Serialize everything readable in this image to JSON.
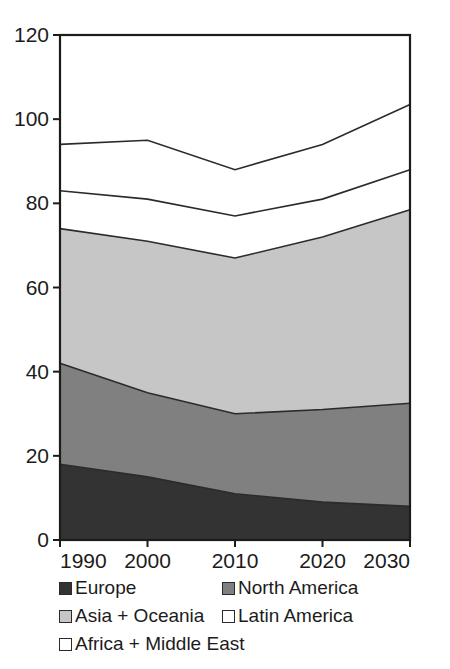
{
  "chart_data": {
    "type": "area",
    "stacked": true,
    "title": "",
    "subtitle": "",
    "xlabel": "",
    "ylabel": "",
    "categories": [
      "1990",
      "2000",
      "2010",
      "2020",
      "2030"
    ],
    "x": [
      1990,
      2000,
      2010,
      2020,
      2030
    ],
    "xlim": [
      1990,
      2030
    ],
    "ylim": [
      0,
      120
    ],
    "yticks": [
      0,
      20,
      40,
      60,
      80,
      100,
      120
    ],
    "ytick_labels": [
      "0",
      "20",
      "40",
      "60",
      "80",
      "100",
      "120"
    ],
    "xtick_labels": [
      "1990",
      "2000",
      "2010",
      "2020",
      "2030"
    ],
    "grid": "horizontal-at-100-only",
    "legend_position": "bottom",
    "series": [
      {
        "name": "Europe",
        "color": "#333333",
        "values": [
          18,
          15,
          11,
          9,
          8
        ],
        "cumulative": [
          18,
          15,
          11,
          9,
          8
        ]
      },
      {
        "name": "North America",
        "color": "#808080",
        "values": [
          24,
          20,
          19,
          22,
          24.5
        ],
        "cumulative": [
          42,
          35,
          30,
          31,
          32.5
        ]
      },
      {
        "name": "Asia + Oceania",
        "color": "#c6c6c6",
        "values": [
          32,
          36,
          37,
          41,
          46
        ],
        "cumulative": [
          74,
          71,
          67,
          72,
          78.5
        ]
      },
      {
        "name": "Latin America",
        "color": "#ffffff",
        "values": [
          9,
          10,
          10,
          9,
          9.5
        ],
        "cumulative": [
          83,
          81,
          77,
          81,
          88
        ]
      },
      {
        "name": "Africa + Middle East",
        "color": "#ffffff",
        "values": [
          11,
          14,
          11,
          13,
          15.5
        ],
        "cumulative": [
          94,
          95,
          88,
          94,
          103.5
        ]
      }
    ]
  },
  "axes": {
    "y_ticks": [
      {
        "label": "120",
        "value": 120
      },
      {
        "label": "100",
        "value": 100
      },
      {
        "label": "80",
        "value": 80
      },
      {
        "label": "60",
        "value": 60
      },
      {
        "label": "40",
        "value": 40
      },
      {
        "label": "20",
        "value": 20
      },
      {
        "label": "0",
        "value": 0
      }
    ],
    "x_ticks": [
      {
        "label": "1990",
        "value": 1990
      },
      {
        "label": "2000",
        "value": 2000
      },
      {
        "label": "2010",
        "value": 2010
      },
      {
        "label": "2020",
        "value": 2020
      },
      {
        "label": "2030",
        "value": 2030
      }
    ]
  },
  "legend": {
    "rows": [
      [
        {
          "label": "Europe",
          "color": "#333333"
        },
        {
          "label": "North America",
          "color": "#808080"
        }
      ],
      [
        {
          "label": "Asia + Oceania",
          "color": "#c6c6c6"
        },
        {
          "label": "Latin America",
          "color": "#ffffff"
        }
      ],
      [
        {
          "label": "Africa + Middle East",
          "color": "#ffffff"
        }
      ]
    ]
  },
  "colors": {
    "europe": "#333333",
    "north_america": "#808080",
    "asia_oceania": "#c6c6c6",
    "latin_america": "#ffffff",
    "africa_middle_east": "#ffffff",
    "axis": "#1c1c1c",
    "gridline": "#b9b9b9",
    "series_outline": "#2b2b2b",
    "background": "#ffffff"
  }
}
